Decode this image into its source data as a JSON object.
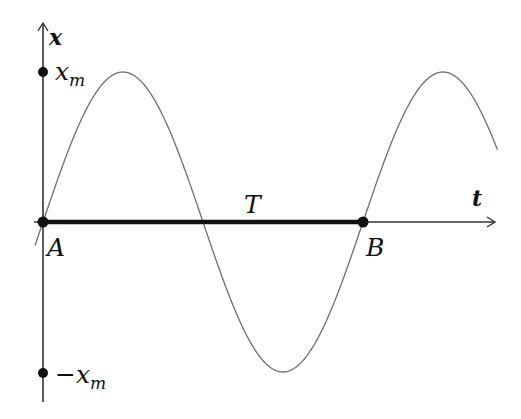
{
  "diagram": {
    "axes": {
      "y_label": "x",
      "x_label": "t"
    },
    "labels": {
      "amplitude_pos": "x",
      "amplitude_pos_sub": "m",
      "amplitude_neg": "−x",
      "amplitude_neg_sub": "m",
      "point_a": "A",
      "point_b": "B",
      "period": "T"
    },
    "colors": {
      "axis": "#333333",
      "curve": "#6e6e6e",
      "period_segment": "#111111",
      "points": "#111111"
    }
  },
  "chart_data": {
    "type": "line",
    "title": "",
    "xlabel": "t",
    "ylabel": "x",
    "function": "x(t) = x_m * sin(2*pi*t/T)",
    "series": [
      {
        "name": "x(t)",
        "description": "sinusoid starting at origin A, one full period T ends at B, continues to ~1.45 periods",
        "x": [
          0,
          0.25,
          0.5,
          0.75,
          1.0,
          1.25,
          1.42
        ],
        "values": [
          0,
          1,
          0,
          -1,
          0,
          1,
          0.43
        ]
      }
    ],
    "annotations": [
      {
        "label": "x_m",
        "x": 0,
        "y": 1
      },
      {
        "label": "-x_m",
        "x": 0,
        "y": -1
      },
      {
        "label": "A",
        "x": 0,
        "y": 0
      },
      {
        "label": "B",
        "x": 1,
        "y": 0
      },
      {
        "label": "T",
        "type": "segment",
        "from": 0,
        "to": 1
      }
    ],
    "ylim": [
      -1.05,
      1.1
    ],
    "grid": false
  }
}
